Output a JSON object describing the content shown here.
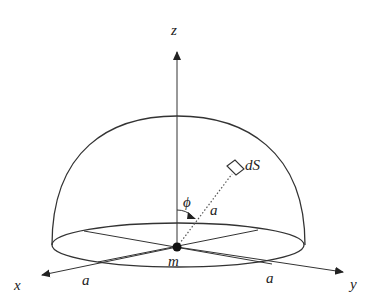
{
  "diagram": {
    "type": "hemisphere-gravitation",
    "labels": {
      "z_axis": "z",
      "x_axis": "x",
      "y_axis": "y",
      "mass": "m",
      "angle": "ϕ",
      "radius_slant": "a",
      "radius_x": "a",
      "radius_y": "a",
      "surface_element": "dS"
    },
    "colors": {
      "stroke": "#333333",
      "text": "#222222",
      "background": "#ffffff"
    }
  }
}
